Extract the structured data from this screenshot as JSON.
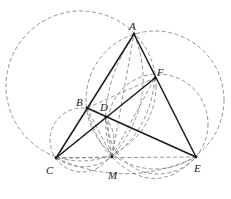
{
  "diagram": {
    "type": "geometry",
    "points": {
      "A": {
        "label": "A",
        "x": 134,
        "y": 34,
        "lx": 129,
        "ly": 30
      },
      "B": {
        "label": "B",
        "x": 87,
        "y": 108,
        "lx": 76,
        "ly": 106
      },
      "C": {
        "label": "C",
        "x": 56,
        "y": 158,
        "lx": 46,
        "ly": 174
      },
      "D": {
        "label": "D",
        "x": 106,
        "y": 117,
        "lx": 100,
        "ly": 111
      },
      "E": {
        "label": "E",
        "x": 196,
        "y": 157,
        "lx": 194,
        "ly": 172
      },
      "F": {
        "label": "F",
        "x": 155,
        "y": 78,
        "lx": 157,
        "ly": 76
      },
      "M": {
        "label": "M",
        "x": 112,
        "y": 157,
        "lx": 108,
        "ly": 179
      }
    },
    "solid_segments": [
      [
        "A",
        "C"
      ],
      [
        "A",
        "E"
      ],
      [
        "B",
        "E"
      ],
      [
        "C",
        "F"
      ]
    ],
    "dashed_segments": [
      [
        "C",
        "E"
      ],
      [
        "M",
        "A"
      ],
      [
        "M",
        "B"
      ],
      [
        "M",
        "D"
      ],
      [
        "M",
        "F"
      ]
    ],
    "circles": [
      {
        "name": "circle-ABC-large",
        "cx": 81,
        "cy": 86,
        "r": 75
      },
      {
        "name": "circle-ABE-large",
        "cx": 155,
        "cy": 100,
        "r": 69
      },
      {
        "name": "circle-DFEM",
        "cx": 158,
        "cy": 124,
        "r": 50
      },
      {
        "name": "circle-BCM",
        "cx": 82,
        "cy": 140,
        "r": 32
      }
    ]
  }
}
